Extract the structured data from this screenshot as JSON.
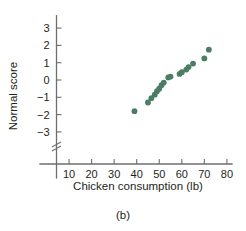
{
  "chart_data": {
    "type": "scatter",
    "title": "",
    "xlabel": "Chicken consumption (lb)",
    "ylabel": "Normal score",
    "caption": "(b)",
    "grid": false,
    "legend": "none",
    "marker_color": "#4a7d63",
    "axis_color": "#6e6e6e",
    "xlim": [
      0,
      85
    ],
    "ylim": [
      -3.8,
      3.6
    ],
    "xticks": [
      10,
      20,
      30,
      40,
      50,
      60,
      70,
      80
    ],
    "xtick_labels": [
      "10",
      "20",
      "30",
      "40",
      "50",
      "60",
      "70",
      "80"
    ],
    "yticks": [
      -3,
      -2,
      -1,
      0,
      1,
      2,
      3
    ],
    "ytick_labels": [
      "−3",
      "−2",
      "−1",
      "0",
      "1",
      "2",
      "3"
    ],
    "y_axis_break": true,
    "points": [
      {
        "x": 39.0,
        "y": -1.8
      },
      {
        "x": 45.0,
        "y": -1.3
      },
      {
        "x": 46.5,
        "y": -1.05
      },
      {
        "x": 48.0,
        "y": -0.85
      },
      {
        "x": 49.0,
        "y": -0.65
      },
      {
        "x": 50.0,
        "y": -0.5
      },
      {
        "x": 51.0,
        "y": -0.3
      },
      {
        "x": 52.0,
        "y": -0.15
      },
      {
        "x": 54.0,
        "y": 0.15
      },
      {
        "x": 55.0,
        "y": 0.2
      },
      {
        "x": 59.0,
        "y": 0.35
      },
      {
        "x": 60.0,
        "y": 0.45
      },
      {
        "x": 62.0,
        "y": 0.6
      },
      {
        "x": 63.0,
        "y": 0.75
      },
      {
        "x": 65.0,
        "y": 0.95
      },
      {
        "x": 70.0,
        "y": 1.25
      },
      {
        "x": 72.0,
        "y": 1.75
      }
    ]
  }
}
